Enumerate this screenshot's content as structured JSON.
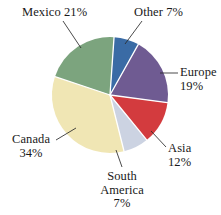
{
  "chart_data": {
    "type": "pie",
    "title": "",
    "subtitle": "",
    "xlabel": "",
    "ylabel": "",
    "legend": "none",
    "grid": false,
    "value_unit": "%",
    "total": 100,
    "categories": [
      "Other",
      "Europe",
      "Asia",
      "South America",
      "Canada",
      "Mexico"
    ],
    "values": [
      7,
      19,
      12,
      7,
      34,
      21
    ],
    "colors": [
      "#3a6ba5",
      "#6f5b92",
      "#d33b3e",
      "#ccd3e2",
      "#f0e6b4",
      "#7ca47e"
    ],
    "slices": [
      {
        "name": "Other",
        "value": 7,
        "color": "#3a6ba5",
        "label_text": "Other 7%"
      },
      {
        "name": "Europe",
        "value": 19,
        "color": "#6f5b92",
        "label_text": "Europe 19%"
      },
      {
        "name": "Asia",
        "value": 12,
        "color": "#d33b3e",
        "label_text": "Asia 12%"
      },
      {
        "name": "South America",
        "value": 7,
        "color": "#ccd3e2",
        "label_text": "South America 7%"
      },
      {
        "name": "Canada",
        "value": 34,
        "color": "#f0e6b4",
        "label_text": "Canada 34%"
      },
      {
        "name": "Mexico",
        "value": 21,
        "color": "#7ca47e",
        "label_text": "Mexico 21%"
      }
    ]
  },
  "labels": {
    "mexico": {
      "line1": "Mexico 21%"
    },
    "other": {
      "line1": "Other 7%"
    },
    "europe": {
      "line1": "Europe",
      "line2": "19%"
    },
    "asia": {
      "line1": "Asia",
      "line2": "12%"
    },
    "south_america": {
      "line1": "South",
      "line2": "America",
      "line3": "7%"
    },
    "canada": {
      "line1": "Canada",
      "line2": "34%"
    }
  }
}
